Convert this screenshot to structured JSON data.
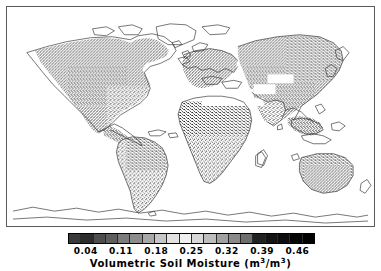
{
  "figure": {
    "kind": "world-map-with-colorbar",
    "background_color": "#ffffff",
    "frame_color": "#5a5a5a"
  },
  "map": {
    "projection": "equirectangular",
    "lon_range": [
      -180,
      180
    ],
    "lat_range": [
      -90,
      90
    ],
    "coastline_color": "#3c3c3c",
    "land_fill_note": "speckled grayscale soil-moisture raster over land; ocean white; Antarctica outline only (no data); white no-data band across Sahara/Arabia",
    "regions_with_data": [
      "North America",
      "South America",
      "Europe",
      "Africa",
      "Asia",
      "Australia"
    ]
  },
  "colorbar": {
    "title": "Volumetric Soil Moisture (m",
    "title_full": "Volumetric Soil Moisture (m³/m³)",
    "title_part_a": "Volumetric Soil Moisture (m",
    "title_sup_a": "3",
    "title_mid": "/m",
    "title_sup_b": "3",
    "title_part_b": ")",
    "orientation": "horizontal",
    "tick_labels": [
      "0.04",
      "0.11",
      "0.18",
      "0.25",
      "0.32",
      "0.39",
      "0.46"
    ],
    "tick_values": [
      0.04,
      0.11,
      0.18,
      0.25,
      0.32,
      0.39,
      0.46
    ],
    "vmin": 0.005,
    "vmax": 0.495,
    "segment_colors": [
      "#3a3a3a",
      "#2c2c2c",
      "#4e4e4e",
      "#5e5e5e",
      "#7b7b7b",
      "#8c8c8c",
      "#a8a8a8",
      "#c6c6c6",
      "#e2e2e2",
      "#efefef",
      "#d8d8d8",
      "#bdbdbd",
      "#a0a0a0",
      "#8a8a8a",
      "#6e6e6e",
      "#222222",
      "#141414",
      "#0d0d0d",
      "#050505",
      "#000000"
    ],
    "border_color": "#000000"
  },
  "chart_data": {
    "type": "heatmap",
    "xlabel": "Longitude",
    "ylabel": "Latitude",
    "colorbar_label": "Volumetric Soil Moisture (m³/m³)",
    "colormap": "grayscale-cyclic",
    "xlim": [
      -180,
      180
    ],
    "ylim": [
      -90,
      90
    ],
    "grid": false,
    "legend_position": "below",
    "cbar_ticks": [
      0.04,
      0.11,
      0.18,
      0.25,
      0.32,
      0.39,
      0.46
    ],
    "cbar_tick_labels": [
      "0.04",
      "0.11",
      "0.18",
      "0.25",
      "0.32",
      "0.39",
      "0.46"
    ],
    "cbar_range": [
      0.005,
      0.495
    ],
    "units": "m3/m3"
  }
}
